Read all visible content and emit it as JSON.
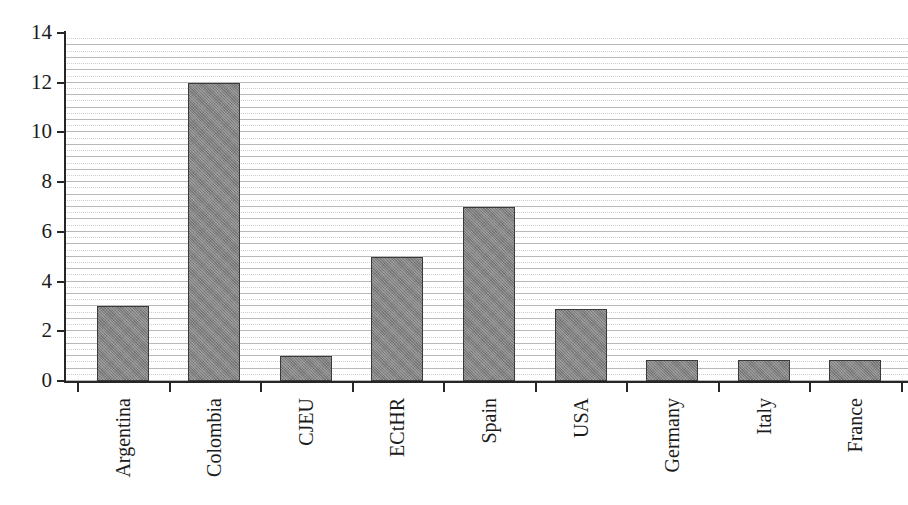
{
  "chart_data": {
    "type": "bar",
    "title": "",
    "subtitle": "",
    "xlabel": "",
    "ylabel": "",
    "categories": [
      "Argentina",
      "Colombia",
      "CJEU",
      "ECtHR",
      "Spain",
      "USA",
      "Germany",
      "Italy",
      "France"
    ],
    "values": [
      3,
      12,
      1,
      5,
      7,
      2.9,
      0.85,
      0.85,
      0.85
    ],
    "ylim": [
      0,
      14
    ],
    "ytick_labels": [
      "0",
      "2",
      "4",
      "6",
      "8",
      "10",
      "12",
      "14"
    ],
    "ytick_values": [
      0,
      2,
      4,
      6,
      8,
      10,
      12,
      14
    ],
    "ytick_interval": 2,
    "grid": {
      "horizontal": true,
      "vertical": false,
      "solid_interval": 0.5,
      "dotted_interval": 0.5,
      "solid_color": "#b9b9b9",
      "dotted_color": "#cfcfcf"
    },
    "legend": {
      "visible": false,
      "position": "none",
      "entries": []
    },
    "bar_style": {
      "fill_color": "#818181",
      "edge_color": "#3a3a3a",
      "pattern": "dithered-gray"
    },
    "axis_color": "#262626",
    "background_color": "#ffffff",
    "label_rotation_degrees": 90
  }
}
